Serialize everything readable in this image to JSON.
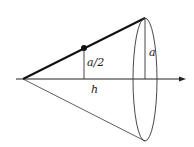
{
  "diagram": {
    "type": "cone-cross-section",
    "labels": {
      "half_radius": "a/2",
      "radius": "a",
      "height": "h"
    },
    "colors": {
      "stroke": "#222222",
      "background": "#ffffff"
    }
  }
}
